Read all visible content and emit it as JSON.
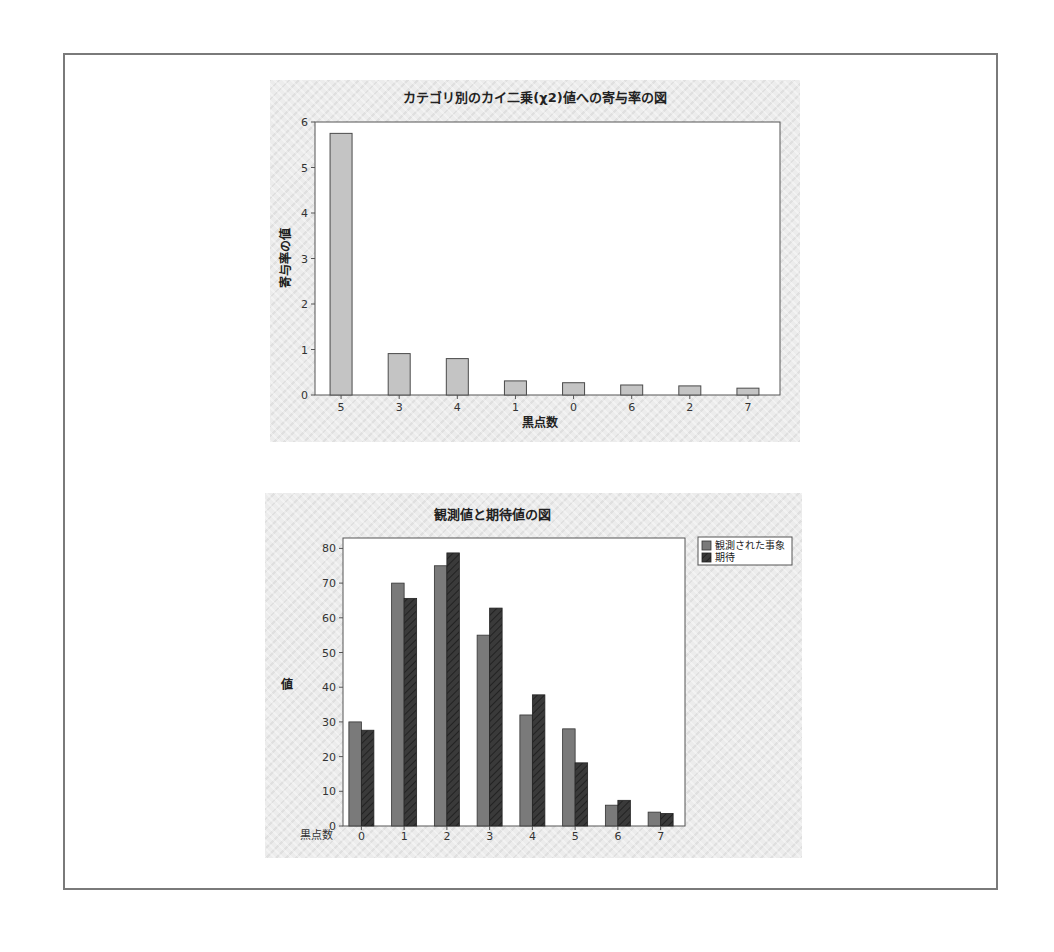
{
  "chart_data": [
    {
      "type": "bar",
      "title": "カテゴリ別のカイ二乗(χ2)値への寄与率の図",
      "xlabel": "黒点数",
      "ylabel": "寄与率の値",
      "categories": [
        "5",
        "3",
        "4",
        "1",
        "0",
        "6",
        "2",
        "7"
      ],
      "values": [
        5.75,
        0.91,
        0.8,
        0.31,
        0.27,
        0.22,
        0.2,
        0.15
      ],
      "ylim": [
        0,
        6
      ],
      "yticks": [
        0,
        1,
        2,
        3,
        4,
        5,
        6
      ],
      "grid": false,
      "legend": null,
      "colors": {
        "bar": "#c4c4c4",
        "bar_border": "#4a4a4a"
      }
    },
    {
      "type": "bar",
      "title": "観測値と期待値の図",
      "xlabel": "黒点数",
      "ylabel": "値",
      "categories": [
        "0",
        "1",
        "2",
        "3",
        "4",
        "5",
        "6",
        "7"
      ],
      "series": [
        {
          "name": "観測された事象",
          "values": [
            30,
            70,
            75,
            55,
            32,
            28,
            6,
            4
          ],
          "color": "#7a7a7a"
        },
        {
          "name": "期待",
          "values": [
            27.6,
            65.6,
            78.7,
            62.8,
            37.8,
            18.2,
            7.4,
            3.6
          ],
          "color": "#3a3a3a"
        }
      ],
      "ylim": [
        0,
        83
      ],
      "yticks": [
        0,
        10,
        20,
        30,
        40,
        50,
        60,
        70,
        80
      ],
      "grid": false,
      "legend": {
        "position": "right-top"
      }
    }
  ]
}
